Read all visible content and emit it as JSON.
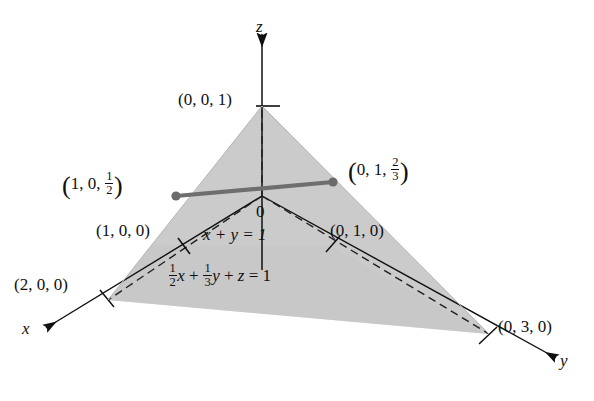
{
  "figure": {
    "background_color": "#ffffff",
    "plane_fill_color": "#c8c8c8",
    "line_color": "#101010",
    "segment_color": "#6e6e6e"
  },
  "axes": [
    {
      "name": "x-axis",
      "label": "x",
      "direction": "down-left"
    },
    {
      "name": "y-axis",
      "label": "y",
      "direction": "down-right"
    },
    {
      "name": "z-axis",
      "label": "z",
      "direction": "up"
    }
  ],
  "origin": {
    "label": "0"
  },
  "points": {
    "z_intercept": "(0, 0, 1)",
    "x_intercept": "(2, 0, 0)",
    "y_intercept": "(0, 3, 0)",
    "unit_x": "(1, 0, 0)",
    "unit_y": "(0, 1, 0)"
  },
  "segment_endpoints": {
    "left": {
      "x": "1",
      "y": "0",
      "z_num": "1",
      "z_den": "2"
    },
    "right": {
      "x": "0",
      "y": "1",
      "z_num": "2",
      "z_den": "3"
    }
  },
  "equations": {
    "line": "x + y = 1",
    "plane": {
      "coef_x_num": "1",
      "coef_x_den": "2",
      "var_x": "x",
      "plus_1": "+",
      "coef_y_num": "1",
      "coef_y_den": "3",
      "var_y": "y",
      "plus_2": "+",
      "var_z": "z",
      "equals": "= 1"
    }
  }
}
